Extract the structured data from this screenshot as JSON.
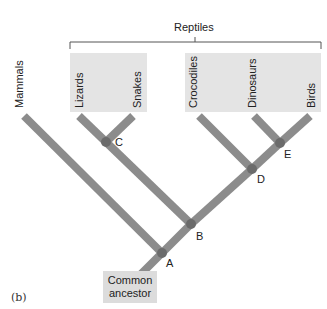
{
  "figure": {
    "panel_label": "(b)",
    "group": {
      "label": "Reptiles"
    },
    "taxa": [
      {
        "id": "mammals",
        "label": "Mammals"
      },
      {
        "id": "lizards",
        "label": "Lizards"
      },
      {
        "id": "snakes",
        "label": "Snakes"
      },
      {
        "id": "crocodiles",
        "label": "Crocodiles"
      },
      {
        "id": "dinosaurs",
        "label": "Dinosaurs"
      },
      {
        "id": "birds",
        "label": "Birds"
      }
    ],
    "nodes": [
      {
        "id": "A",
        "label": "A"
      },
      {
        "id": "B",
        "label": "B"
      },
      {
        "id": "C",
        "label": "C"
      },
      {
        "id": "D",
        "label": "D"
      },
      {
        "id": "E",
        "label": "E"
      }
    ],
    "root": {
      "line1": "Common",
      "line2": "ancestor"
    },
    "tree": "(Mammals,((Lizards,Snakes)C,(Crocodiles,(Dinosaurs,Birds)E)D)B)A",
    "colors": {
      "branch": "#8c8c8c",
      "node": "#6b6b6b",
      "box": "#e4e4e4",
      "ancestor_box": "#dcdcdc",
      "bracket": "#555555"
    }
  }
}
